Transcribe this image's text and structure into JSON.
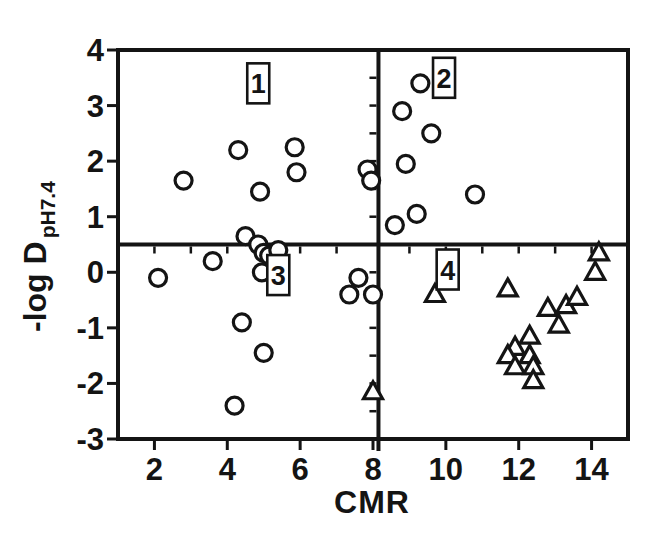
{
  "figure": {
    "ylabel_main": "-log D",
    "ylabel_sub": "pH7.4",
    "ink_color": "#141414",
    "background_color": "#ffffff"
  },
  "chart_data": {
    "type": "scatter",
    "title": "",
    "xlabel": "CMR",
    "ylabel": "-log D pH7.4",
    "xlim": [
      1,
      15
    ],
    "ylim": [
      -3,
      4
    ],
    "x_ticks": [
      2,
      4,
      6,
      8,
      10,
      12,
      14
    ],
    "y_ticks": [
      4,
      3,
      2,
      1,
      0,
      -1,
      -2,
      -3
    ],
    "grid": false,
    "legend": "none",
    "quadrant_divider_x": 8.15,
    "quadrant_divider_y": 0.5,
    "quadrant_labels": [
      {
        "label": "1",
        "x": 4.85,
        "y": 3.4
      },
      {
        "label": "2",
        "x": 9.95,
        "y": 3.5
      },
      {
        "label": "3",
        "x": 5.4,
        "y": -0.05
      },
      {
        "label": "4",
        "x": 10.05,
        "y": 0.05
      }
    ],
    "series": [
      {
        "name": "circle-series",
        "marker": "circle",
        "points": [
          [
            2.8,
            1.65
          ],
          [
            4.3,
            2.2
          ],
          [
            4.9,
            1.45
          ],
          [
            5.85,
            2.25
          ],
          [
            5.9,
            1.8
          ],
          [
            4.5,
            0.65
          ],
          [
            7.85,
            1.85
          ],
          [
            7.95,
            1.65
          ],
          [
            8.6,
            0.85
          ],
          [
            8.8,
            2.9
          ],
          [
            8.9,
            1.95
          ],
          [
            9.2,
            1.05
          ],
          [
            9.3,
            3.4
          ],
          [
            9.6,
            2.5
          ],
          [
            10.8,
            1.4
          ],
          [
            2.1,
            -0.1
          ],
          [
            3.6,
            0.2
          ],
          [
            4.85,
            0.5
          ],
          [
            5.0,
            0.35
          ],
          [
            5.15,
            0.3
          ],
          [
            5.4,
            0.4
          ],
          [
            4.95,
            0.0
          ],
          [
            4.4,
            -0.9
          ],
          [
            5.0,
            -1.45
          ],
          [
            4.2,
            -2.4
          ],
          [
            7.6,
            -0.1
          ],
          [
            7.35,
            -0.4
          ],
          [
            8.0,
            -0.4
          ]
        ]
      },
      {
        "name": "triangle-series",
        "marker": "triangle",
        "points": [
          [
            8.0,
            -2.15
          ],
          [
            9.7,
            -0.4
          ],
          [
            11.7,
            -0.3
          ],
          [
            11.9,
            -1.35
          ],
          [
            11.7,
            -1.5
          ],
          [
            11.9,
            -1.7
          ],
          [
            12.3,
            -1.15
          ],
          [
            12.3,
            -1.5
          ],
          [
            12.4,
            -1.7
          ],
          [
            12.4,
            -1.95
          ],
          [
            12.8,
            -0.65
          ],
          [
            13.1,
            -0.95
          ],
          [
            13.3,
            -0.6
          ],
          [
            13.6,
            -0.45
          ],
          [
            14.1,
            0.0
          ],
          [
            14.2,
            0.35
          ]
        ]
      }
    ]
  }
}
